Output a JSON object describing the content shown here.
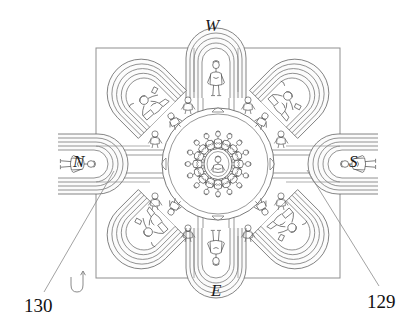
{
  "figure": {
    "kind": "architectural-plan-line-drawing",
    "stroke_color": "#555555",
    "frame_color": "#8a8a8a",
    "leader_color": "#7a7a7a",
    "background": "#ffffff",
    "text_color": "#111111"
  },
  "compass_labels": [
    {
      "id": "w",
      "text": "W",
      "position": "top"
    },
    {
      "id": "n",
      "text": "N",
      "position": "left"
    },
    {
      "id": "s",
      "text": "S",
      "position": "right"
    },
    {
      "id": "e",
      "text": "E",
      "position": "bottom"
    }
  ],
  "reference_numerals": [
    {
      "id": "130",
      "text": "130",
      "position": "bottom-left",
      "points_to": "north-arm-shrine"
    },
    {
      "id": "129",
      "text": "129",
      "position": "bottom-right",
      "points_to": "south-arm-shrine"
    }
  ],
  "orientation_marker": {
    "name": "hook-arrow-marker",
    "glyph": "U-shaped hook with upward arrow",
    "position": "bottom-left-inside"
  },
  "plan_elements": {
    "frame": {
      "label": "square-plan-boundary"
    },
    "center": {
      "label": "central-circular-rosette",
      "radiating_figures": 16
    },
    "arms": [
      {
        "label": "west-arm",
        "direction": "top",
        "type": "nested-arch-niche",
        "figures": 1
      },
      {
        "label": "east-arm",
        "direction": "bottom",
        "type": "nested-arch-niche",
        "figures": 1
      },
      {
        "label": "north-arm",
        "direction": "left",
        "type": "nested-arch-niche",
        "figures": 1
      },
      {
        "label": "south-arm",
        "direction": "right",
        "type": "nested-arch-niche",
        "figures": 1
      }
    ],
    "corner_shrines": [
      {
        "label": "northwest-corner-shrine",
        "angle_deg": 315
      },
      {
        "label": "northeast-corner-shrine",
        "angle_deg": 45
      },
      {
        "label": "southeast-corner-shrine",
        "angle_deg": 135
      },
      {
        "label": "southwest-corner-shrine",
        "angle_deg": 225
      }
    ]
  }
}
